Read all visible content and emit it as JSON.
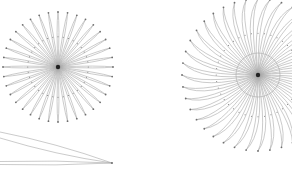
{
  "figure": {
    "width": 292,
    "height": 174,
    "background": "#ffffff",
    "stroke_color": "#6e6e6e",
    "stroke_light": "#a8a8a8",
    "center_color": "#222222"
  },
  "diagrams": [
    {
      "name": "left-starburst",
      "cx": 58,
      "cy": 67,
      "petals": 36,
      "radius": 55,
      "petal_width_deg": 2.6,
      "curl": 0
    },
    {
      "name": "right-starburst",
      "cx": 258,
      "cy": 75,
      "petals": 40,
      "radius": 76,
      "inner_circle_radius": 22,
      "petal_width_deg": 3.2,
      "curl": 18
    },
    {
      "name": "bottom-lens",
      "tip": [
        112,
        163
      ],
      "lenses": [
        {
          "start": [
            0,
            135
          ],
          "bulge": 6
        },
        {
          "start": [
            0,
            163
          ],
          "bulge": 3
        }
      ]
    }
  ]
}
